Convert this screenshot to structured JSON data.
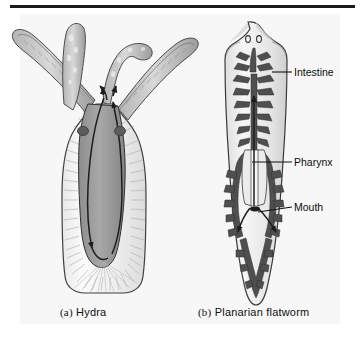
{
  "figure": {
    "background_color": "#f7f7f7",
    "rule_color": "#1b1b1b",
    "ink_color": "#2b2b2b"
  },
  "captions": [
    {
      "index": "(a)",
      "label": "Hydra"
    },
    {
      "index": "(b)",
      "label": "Planarian flatworm"
    }
  ],
  "labels": [
    {
      "id": "intestine",
      "text": "Intestine"
    },
    {
      "id": "pharynx",
      "text": "Pharynx"
    },
    {
      "id": "mouth",
      "text": "Mouth"
    }
  ],
  "organisms": {
    "hydra": {
      "name": "Hydra",
      "panel": "a",
      "features": [
        "tentacles",
        "mouth",
        "gastrovascular cavity",
        "body stalk",
        "basal disc"
      ],
      "tentacle_count": 4,
      "flow_arrows": 6,
      "cavity_fill": "#9a9a9a"
    },
    "planarian": {
      "name": "Planarian flatworm",
      "panel": "b",
      "features": [
        "eyespots",
        "branched intestine",
        "pharynx",
        "mouth"
      ],
      "eyespot_count": 2,
      "flow_arrows": 3,
      "intestine_fill": "#4a4a4a"
    }
  }
}
